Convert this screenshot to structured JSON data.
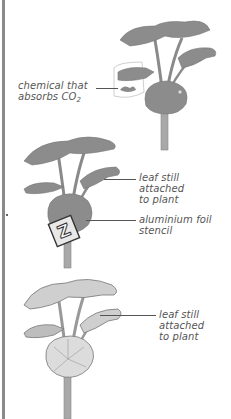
{
  "figure": {
    "panels": [
      {
        "id": "plant-co2",
        "label_lines": [
          "chemical that",
          "absorbs CO"
        ],
        "label_subscript": "2",
        "leaf_color": "#8c8c8c",
        "bag_outline_color": "#c8c8c8"
      },
      {
        "id": "plant-foil",
        "labels": [
          {
            "lines": [
              "leaf still",
              "attached",
              "to plant"
            ]
          },
          {
            "lines": [
              "aluminium foil",
              "stencil"
            ]
          }
        ],
        "stencil_letter": "Z",
        "leaf_color": "#8c8c8c"
      },
      {
        "id": "plant-variegated",
        "labels": [
          {
            "lines": [
              "leaf still",
              "attached",
              "to plant"
            ]
          }
        ],
        "leaf_color": "#b5b5b5"
      }
    ],
    "colors": {
      "text": "#555555",
      "stem": "#9a9a9a",
      "leaf_dark": "#8c8c8c",
      "leaf_light": "#d0d0d0",
      "left_bar": "#8a8a8a"
    }
  }
}
